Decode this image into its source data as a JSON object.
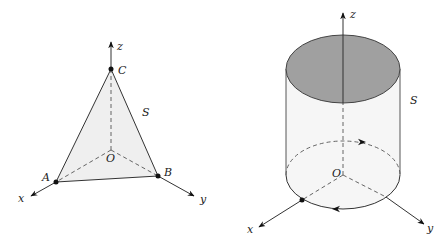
{
  "figures": [
    {
      "name": "tetrahedron",
      "labels": {
        "z": "z",
        "x": "x",
        "y": "y",
        "A": "A",
        "B": "B",
        "C": "C",
        "O": "O",
        "S": "S"
      }
    },
    {
      "name": "cylinder",
      "labels": {
        "z": "z",
        "x": "x",
        "y": "y",
        "O": "O",
        "S": "S"
      }
    }
  ],
  "colors": {
    "line": "#333333",
    "face": "#ececec",
    "top_fill": "#9a9a9a",
    "side_fill": "#f4f4f4"
  }
}
